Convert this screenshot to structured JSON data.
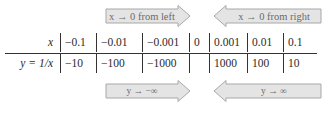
{
  "arrows": {
    "top_left": {
      "label": "x → 0 from left",
      "direction": "right"
    },
    "top_right": {
      "label": "x → 0 from right",
      "direction": "left"
    },
    "bottom_left": {
      "label": "y → −∞",
      "direction": "right"
    },
    "bottom_right": {
      "label": "y → ∞",
      "direction": "left"
    }
  },
  "table": {
    "row_x_label": "x",
    "row_y_label": "y = 1/x",
    "x_values": [
      "−0.1",
      "−0.01",
      "−0.001",
      "0",
      "0.001",
      "0.01",
      "0.1"
    ],
    "y_values": [
      "−10",
      "−100",
      "−1000",
      "",
      "1000",
      "100",
      "10"
    ]
  },
  "colors": {
    "arrow_fill": "#e4e4e4",
    "arrow_stroke": "#a8a8a8",
    "text": "#2a2a2a"
  }
}
